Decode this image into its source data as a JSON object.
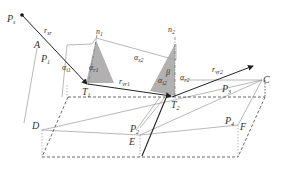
{
  "diagram": {
    "type": "geometric-ray-reflection",
    "points": {
      "source": {
        "label": "P",
        "sub": "s"
      },
      "A": {
        "label": "A"
      },
      "P1": {
        "label": "P",
        "sub": "1"
      },
      "T1": {
        "label": "T",
        "sub": "1"
      },
      "T2": {
        "label": "T",
        "sub": "2"
      },
      "C": {
        "label": "C"
      },
      "D": {
        "label": "D"
      },
      "E": {
        "label": "E"
      },
      "F": {
        "label": "F"
      },
      "P2": {
        "label": "P",
        "sub": "2"
      },
      "P3": {
        "label": "P",
        "sub": "3"
      },
      "P4": {
        "label": "P",
        "sub": "4"
      }
    },
    "vectors": {
      "r_sr": {
        "label": "r",
        "sub": "sr"
      },
      "r_vr1": {
        "label": "r",
        "sub": "vr1"
      },
      "r_vr2": {
        "label": "r",
        "sub": "vr2"
      }
    },
    "normals": {
      "n1": {
        "label": "n",
        "sub": "1"
      },
      "n2": {
        "label": "n",
        "sub": "2"
      }
    },
    "angles": {
      "alpha_i1": {
        "label": "α",
        "sub": "i1"
      },
      "alpha_r1": {
        "label": "α",
        "sub": "r1"
      },
      "alpha_i2": {
        "label": "α",
        "sub": "i2"
      },
      "alpha_s2": {
        "label": "α",
        "sub": "s2"
      },
      "alpha_r2": {
        "label": "α",
        "sub": "r2"
      },
      "beta": {
        "label": "β"
      }
    },
    "colors": {
      "line": "#333333",
      "light_line": "#999999",
      "triangle_fill": "#a8a8a8",
      "dashed": "#444444"
    }
  }
}
